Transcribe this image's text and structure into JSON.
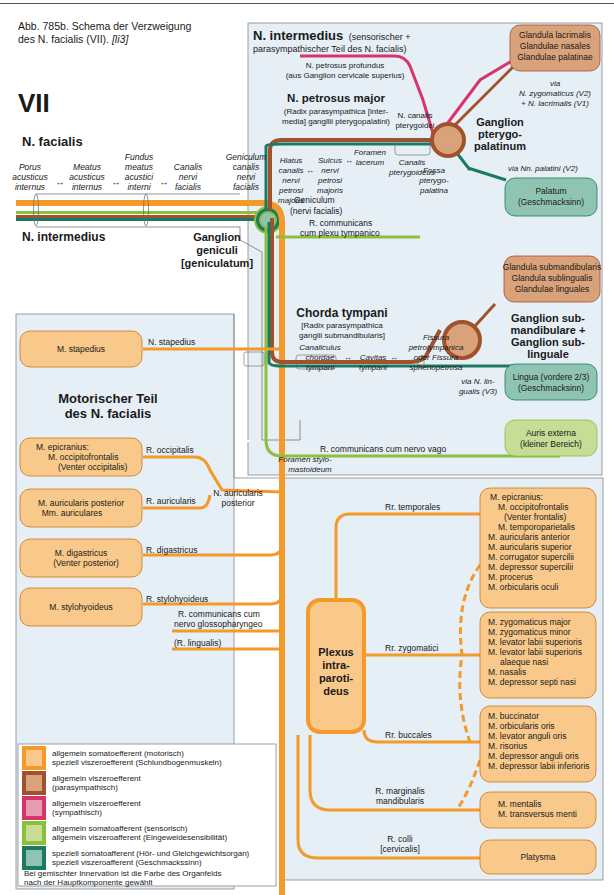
{
  "caption": {
    "text": "Abb. 785b. Schema der Verzweigung",
    "text2": "des N. facialis (VII).",
    "ref": "[li3]"
  },
  "colors": {
    "motor": "#f39a2a",
    "motor_fill": "#f8c98a",
    "parasym": "#a0522d",
    "parasym_fill": "#d9a27a",
    "sym": "#d8346b",
    "sym_fill": "#e79bb0",
    "sensory": "#8cbf3a",
    "sensory_fill": "#c5dd96",
    "special": "#1d7a62",
    "special_fill": "#8fc3b2",
    "panel_bg": "#e6eef6"
  },
  "header": {
    "numeral": "VII",
    "facialis": "N. facialis",
    "intermedius": "N. intermedius",
    "ganglion_geniculi": [
      "Ganglion",
      "geniculi",
      "[geniculatum]"
    ]
  },
  "canal_path": [
    {
      "lines": [
        "Porus",
        "acusticus",
        "internus"
      ]
    },
    {
      "lines": [
        "Meatus",
        "acusticus",
        "internus"
      ]
    },
    {
      "lines": [
        "Fundus",
        "meatus",
        "acustici",
        "interni"
      ]
    },
    {
      "lines": [
        "Canalis",
        "nervi",
        "facialis"
      ]
    },
    {
      "lines": [
        "Geniculum",
        "canalis",
        "nervi",
        "facialis"
      ]
    }
  ],
  "intermedius_panel": {
    "title": "N. intermedius",
    "title_suffix": "(sensorischer +",
    "title_line2": "parasympathischer Teil des N. facialis)",
    "petrosus_profundus": [
      "N. petrosus profundus",
      "(aus Ganglion cervicale superius)"
    ],
    "petrosus_major": {
      "title": "N. petrosus major",
      "sub": [
        "(Radix parasympathica [inter-",
        "media] gangllii pterygopalatini)"
      ]
    },
    "petrosus_path": [
      {
        "lines": [
          "Hiatus",
          "canalis",
          "nervi",
          "petrosi",
          "majoris"
        ]
      },
      {
        "lines": [
          "Sulcus",
          "nervi",
          "petrosi",
          "majoris"
        ]
      },
      {
        "lines": [
          "Foramen",
          "lacerum"
        ]
      }
    ],
    "canalis_pterygoidei": [
      "N. canalis",
      "pterygoidei"
    ],
    "canalis_pterygoideus": [
      "Canalis",
      "pterygoideus"
    ],
    "fossa": [
      "Fossa",
      "pterygo-",
      "palatina"
    ],
    "ganglion_ptp": [
      "Ganglion",
      "pterygo-",
      "palatinum"
    ],
    "via_zyg": [
      "via",
      "N. zygomaticus (V2)",
      "+ N. lacrimalis (V1)"
    ],
    "via_palatini": "via Nn. palatini (V2)",
    "glandula_lacrimalis": [
      "Glandula lacrimalis",
      "Glandulae nasales",
      "Glandulae palatinae"
    ],
    "palatum": [
      "Palatum",
      "(Geschmacksinn)"
    ],
    "geniculum": [
      "Geniculum",
      "(nervi facialis)"
    ],
    "r_comm_tymp": [
      "R. communicans",
      "cum plexu tympanico"
    ],
    "chorda": {
      "title": "Chorda tympani",
      "sub": [
        "[Radix parasympathica",
        "ganglii submandibularis]"
      ]
    },
    "chorda_path": [
      {
        "lines": [
          "Canaliculus",
          "chordae",
          "tympani"
        ]
      },
      {
        "lines": [
          "Cavitas",
          "tympani"
        ]
      },
      {
        "lines": [
          "Fissura",
          "petrotympanica",
          "oder Fissura",
          "sphenopetrosa"
        ]
      }
    ],
    "glandula_submand": [
      "Glandula submandibularis",
      "Glandula sublingualis",
      "Glandulae linguales"
    ],
    "ganglion_sub": [
      "Ganglion sub-",
      "mandibulare +",
      "Ganglion sub-",
      "linguale"
    ],
    "lingua": [
      "Lingua (vordere 2/3)",
      "(Geschmacksinn)"
    ],
    "via_lingualis": [
      "via N. lin-",
      "gualis (V3)"
    ],
    "r_comm_vago": "R. communicans cum nervo vago",
    "auris": [
      "Auris externa",
      "(kleiner Bereich)"
    ],
    "foramen_stylo": [
      "Foramen stylo-",
      "mastoideum"
    ]
  },
  "motor_panel": {
    "title": [
      "Motorischer Teil",
      "des N. facialis"
    ],
    "stapedius": {
      "box": "M. stapedius",
      "nerve": "N. stapedius"
    },
    "occipitalis": {
      "box": [
        "M. epicranius:",
        "M. occipitofrontalis",
        "(Venter occipitalis)"
      ],
      "nerve": "R. occipitalis"
    },
    "auricularis": {
      "box": [
        "M. auricularis posterior",
        "Mm. auriculares"
      ],
      "nerve": "R. auricularis"
    },
    "n_auricularis_posterior": [
      "N. auricularis",
      "posterior"
    ],
    "digastricus": {
      "box": [
        "M. digastricus",
        "(Venter posterior)"
      ],
      "nerve": "R. digastricus"
    },
    "stylohyoideus": {
      "box": "M. stylohyoideus",
      "nerve": "R. stylohyoideus"
    },
    "r_comm_glosso": [
      "R. communicans cum",
      "nervo glossopharyngeo"
    ],
    "r_lingualis": "(R. lingualis)",
    "plexus": [
      "Plexus",
      "intra-",
      "paroti-",
      "deus"
    ],
    "branches": [
      {
        "label": [
          "Rr. temporales"
        ],
        "box": [
          "M. epicranius:",
          "M. occipitofrontalis",
          "(Venter frontalis)",
          "M. temporoparietalis",
          "M. auricularis anterior",
          "M. auricularis superior",
          "M. corrugator supercilii",
          "M. depressor supercilii",
          "M. procerus",
          "M. orbicularis oculi"
        ]
      },
      {
        "label": [
          "Rr. zygomatici"
        ],
        "box": [
          "M. zygomaticus major",
          "M. zygomaticus minor",
          "M. levator labii superioris",
          "M. levator labii superioris",
          "alaeque nasi",
          "M. nasalis",
          "M. depressor septi nasi"
        ]
      },
      {
        "label": [
          "Rr. buccales"
        ],
        "box": [
          "M. buccinator",
          "M. orbicularis oris",
          "M. levator anguli oris",
          "M. risorius",
          "M. depressor anguli oris",
          "M. depressor labii inferioris"
        ]
      },
      {
        "label": [
          "R. marginalis",
          "mandibularis"
        ],
        "box": [
          "M. mentalis",
          "M. transversus menti"
        ]
      },
      {
        "label": [
          "R. colli",
          "[cervicalis]"
        ],
        "box": [
          "Platysma"
        ]
      }
    ]
  },
  "legend": {
    "items": [
      {
        "lines": [
          "allgemein somatoefferent (motorisch)",
          "speziell viszeroefferent (Schlundbogenmuskeln)"
        ],
        "key": "motor"
      },
      {
        "lines": [
          "allgemein viszeroefferent",
          "(parasympathisch)"
        ],
        "key": "parasym"
      },
      {
        "lines": [
          "allgemein viszeroefferent",
          "(sympathisch)"
        ],
        "key": "sym"
      },
      {
        "lines": [
          "allgemein somatoafferent (sensorisch)",
          "allgemein viszeroafferent (Eingeweidesensibilität)"
        ],
        "key": "sensory"
      },
      {
        "lines": [
          "speziell somatoafferent (Hör- und Gleichgewichtsorgan)",
          "speziell viszeroafferent (Geschmackssinn)"
        ],
        "key": "special"
      }
    ],
    "note": [
      "Bei gemischter Innervation ist die Farbe des Organfelds",
      "nach der Hauptkomponente gewählt"
    ]
  }
}
